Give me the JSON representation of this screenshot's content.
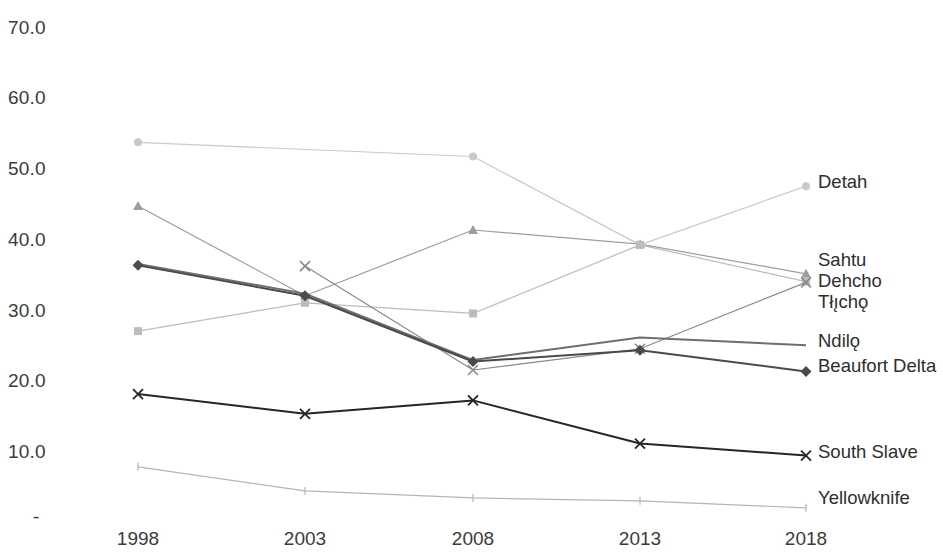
{
  "chart_data": {
    "type": "line",
    "title": "",
    "subtitle": "",
    "xlabel": "",
    "ylabel": "",
    "x": [
      1998,
      2003,
      2008,
      2013,
      2018
    ],
    "categories": [
      "1998",
      "2003",
      "2008",
      "2013",
      "2018"
    ],
    "xtick_labels": [
      "1998",
      "2003",
      "2008",
      "2013",
      "2018"
    ],
    "ytick_labels": [
      "70.0",
      "60.0",
      "50.0",
      "40.0",
      "30.0",
      "20.0",
      "10.0",
      "-"
    ],
    "ytick_values": [
      70.0,
      60.0,
      50.0,
      40.0,
      30.0,
      20.0,
      10.0,
      0.0
    ],
    "ylim": [
      0,
      70
    ],
    "grid": false,
    "legend_position": "right-of-plot-end-labels",
    "series": [
      {
        "name": "Detah",
        "color": "#c9c9c9",
        "marker": "circle",
        "x": [
          1998,
          2008,
          2013,
          2018
        ],
        "values": [
          53.7,
          51.7,
          39.2,
          47.5
        ],
        "label": "Detah"
      },
      {
        "name": "Sahtu",
        "color": "#9d9d9d",
        "marker": "triangle",
        "x": [
          1998,
          2003,
          2008,
          2013,
          2018
        ],
        "values": [
          44.7,
          32.0,
          41.3,
          39.3,
          35.1
        ],
        "label": "Sahtu"
      },
      {
        "name": "Dehcho",
        "color": "#bcbcbc",
        "marker": "square",
        "x": [
          1998,
          2003,
          2008,
          2013,
          2018
        ],
        "values": [
          27.0,
          31.0,
          29.5,
          39.2,
          34.0
        ],
        "label": "Dehcho"
      },
      {
        "name": "Tłı̨chǫ",
        "color": "#8a8a8a",
        "marker": "cross",
        "x": [
          2003,
          2008,
          2013,
          2018
        ],
        "values": [
          36.2,
          21.5,
          24.5,
          33.9
        ],
        "label": "Tłı̨chǫ"
      },
      {
        "name": "Ndilǫ",
        "color": "#6e6e6e",
        "marker": "none",
        "x": [
          1998,
          2003,
          2008,
          2013,
          2018
        ],
        "values": [
          36.5,
          32.3,
          22.9,
          26.1,
          25.0
        ],
        "label": "Ndilǫ"
      },
      {
        "name": "Beaufort Delta",
        "color": "#4a4a4a",
        "marker": "diamond",
        "x": [
          1998,
          2003,
          2008,
          2013,
          2018
        ],
        "values": [
          36.3,
          32.0,
          22.7,
          24.3,
          21.3
        ],
        "label": "Beaufort Delta"
      },
      {
        "name": "South Slave",
        "color": "#262626",
        "marker": "x",
        "x": [
          1998,
          2003,
          2008,
          2013,
          2018
        ],
        "values": [
          18.1,
          15.3,
          17.2,
          11.1,
          9.4
        ],
        "label": "South Slave"
      },
      {
        "name": "Yellowknife",
        "color": "#b4b4b4",
        "marker": "tick",
        "x": [
          1998,
          2003,
          2008,
          2013,
          2018
        ],
        "values": [
          7.8,
          4.4,
          3.4,
          3.0,
          2.0
        ],
        "label": "Yellowknife"
      }
    ]
  },
  "axis": {
    "y_labels": [
      {
        "text": "70.0",
        "top": 17
      },
      {
        "text": "60.0",
        "top": 87
      },
      {
        "text": "50.0",
        "top": 158
      },
      {
        "text": "40.0",
        "top": 229
      },
      {
        "text": "30.0",
        "top": 300
      },
      {
        "text": "20.0",
        "top": 370
      },
      {
        "text": "10.0",
        "top": 441
      },
      {
        "text": "-",
        "top": 506
      }
    ],
    "x_labels": [
      {
        "text": "1998",
        "left": 138
      },
      {
        "text": "2003",
        "left": 305
      },
      {
        "text": "2008",
        "left": 473
      },
      {
        "text": "2013",
        "left": 640
      },
      {
        "text": "2018",
        "left": 806
      }
    ]
  },
  "series_labels": [
    {
      "text": "Detah",
      "left": 818,
      "top": 173
    },
    {
      "text": "Sahtu",
      "left": 818,
      "top": 251
    },
    {
      "text": "Dehcho",
      "left": 818,
      "top": 272
    },
    {
      "text": "Tłı̨chǫ",
      "left": 818,
      "top": 293
    },
    {
      "text": "Ndilǫ",
      "left": 818,
      "top": 332
    },
    {
      "text": "Beaufort Delta",
      "left": 818,
      "top": 357
    },
    {
      "text": "South Slave",
      "left": 818,
      "top": 443
    },
    {
      "text": "Yellowknife",
      "left": 818,
      "top": 489
    }
  ]
}
